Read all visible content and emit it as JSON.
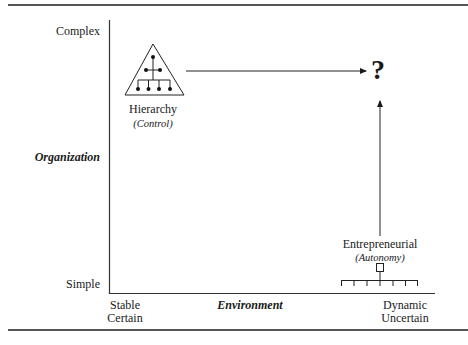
{
  "figure": {
    "y_axis": {
      "title": "Organization",
      "top_label": "Complex",
      "bottom_label": "Simple"
    },
    "x_axis": {
      "title": "Environment",
      "left_label_line1": "Stable",
      "left_label_line2": "Certain",
      "right_label_line1": "Dynamic",
      "right_label_line2": "Uncertain"
    },
    "nodes": [
      {
        "id": "hierarchy",
        "label": "Hierarchy",
        "sublabel": "(Control)",
        "icon": "pyramid-org-chart-icon"
      },
      {
        "id": "entrepreneurial",
        "label": "Entrepreneurial",
        "sublabel": "(Autonomy)",
        "icon": "flat-org-chart-icon"
      },
      {
        "id": "unknown",
        "label": "?",
        "icon": "question-mark"
      }
    ],
    "edges": [
      {
        "from": "hierarchy",
        "to": "unknown",
        "direction": "horizontal"
      },
      {
        "from": "entrepreneurial",
        "to": "unknown",
        "direction": "vertical"
      }
    ],
    "colors": {
      "ink": "#1a1a1a",
      "rule": "#555555",
      "background": "#ffffff"
    }
  }
}
